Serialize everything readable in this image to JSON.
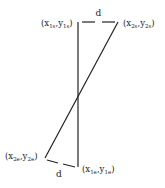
{
  "diagram": {
    "type": "line-segment-distance",
    "stroke_color": "#222222",
    "segment1": {
      "start": {
        "x": 78,
        "y": 22,
        "label_main_x": "x",
        "label_sub_x": "1s",
        "label_main_y": "y",
        "label_sub_y": "1s"
      },
      "end": {
        "x": 78,
        "y": 167,
        "label_main_x": "x",
        "label_sub_x": "1e",
        "label_main_y": "y",
        "label_sub_y": "1e"
      }
    },
    "segment2": {
      "start": {
        "x": 118,
        "y": 22,
        "label_main_x": "x",
        "label_sub_x": "2s",
        "label_main_y": "y",
        "label_sub_y": "2s"
      },
      "end": {
        "x": 45,
        "y": 158,
        "label_main_x": "x",
        "label_sub_x": "2e",
        "label_main_y": "y",
        "label_sub_y": "2e"
      }
    },
    "distance_top": {
      "label": "d"
    },
    "distance_bottom": {
      "label": "d"
    },
    "labels": {
      "p1s": "(x1s,y1s)",
      "p2s": "(x2s,y2s)",
      "p2e": "(x2e,y2e)",
      "p1e": "(x1e,y1e)"
    }
  }
}
